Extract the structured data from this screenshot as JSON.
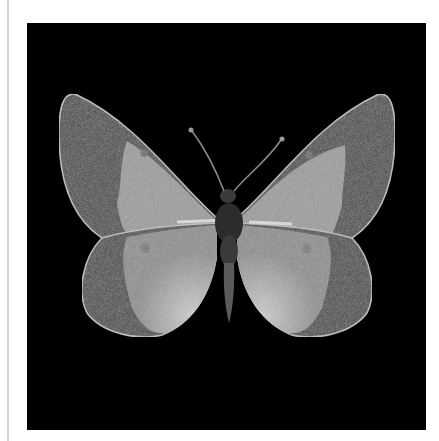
{
  "image": {
    "subject": "Butterfly specimen",
    "description": "Grayscale photograph of a pinned butterfly (Colias-type sulphur) with wings spread, dark outer wing borders, pale inner wings with small discal spots, on a black background",
    "background_color": "#000000",
    "page_color": "#ffffff",
    "colors": {
      "wing_border": "#4a4a4a",
      "wing_inner": "#9a9a9a",
      "wing_highlight": "#c8c8c8",
      "spot": "#6e6e6e",
      "body": "#2c2c2c",
      "edge_line": "#d4d4d4"
    }
  }
}
